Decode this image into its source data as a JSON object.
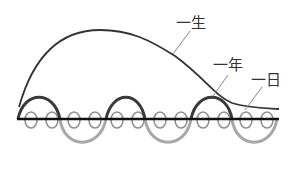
{
  "diagram": {
    "labels": {
      "lifetime": "一生",
      "year": "一年",
      "day": "一日"
    },
    "colors": {
      "lifetime_curve": "#333333",
      "year_arcs_upper": "#3a3a3a",
      "year_arcs_lower": "#a8a8a8",
      "day_circles": "#909090",
      "baseline": "#111111",
      "leader_lines": "#888888"
    },
    "day_circle_count": 12,
    "year_cycle_count": 3
  }
}
